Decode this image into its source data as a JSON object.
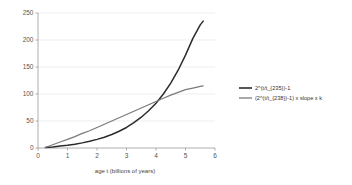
{
  "chart_data": {
    "type": "line",
    "title": "",
    "subtitle": "",
    "xlabel": "age t (billions of years)",
    "ylabel": "",
    "xlim": [
      0,
      6
    ],
    "ylim": [
      0,
      250
    ],
    "xticks": [
      "0",
      "1",
      "2",
      "3",
      "4",
      "5",
      "6"
    ],
    "yticks": [
      "0",
      "50",
      "100",
      "150",
      "200",
      "250"
    ],
    "xtick_values": [
      0,
      1,
      2,
      3,
      4,
      5,
      6
    ],
    "ytick_values": [
      0,
      50,
      100,
      150,
      200,
      250
    ],
    "grid": "horizontal",
    "legend_position": "right",
    "series": [
      {
        "name": "2^(t/t_{235})-1",
        "color": "#2b2b2b",
        "x": [
          0.25,
          0.5,
          0.75,
          1.0,
          1.25,
          1.5,
          1.75,
          2.0,
          2.25,
          2.5,
          2.75,
          3.0,
          3.25,
          3.5,
          3.75,
          4.0,
          4.25,
          4.5,
          4.75,
          5.0,
          5.25,
          5.5,
          5.6
        ],
        "values": [
          1,
          2,
          3.5,
          5,
          7,
          9.5,
          12.5,
          16,
          20,
          25,
          31,
          38,
          47,
          57,
          69,
          83,
          100,
          120,
          144,
          172,
          203,
          228,
          235
        ]
      },
      {
        "name": "(2^(t/t_{238})-1) x slope x k",
        "color": "#7a7a7a",
        "x": [
          0.25,
          0.5,
          0.75,
          1.0,
          1.25,
          1.5,
          1.75,
          2.0,
          2.25,
          2.5,
          2.75,
          3.0,
          3.25,
          3.5,
          3.75,
          4.0,
          4.25,
          4.5,
          4.75,
          5.0,
          5.25,
          5.5,
          5.6
        ],
        "values": [
          1,
          6,
          11,
          16,
          21,
          27,
          32,
          38,
          44,
          50,
          56,
          62,
          68,
          74,
          80,
          86,
          92,
          98,
          103,
          108,
          111,
          114,
          115
        ]
      }
    ]
  }
}
